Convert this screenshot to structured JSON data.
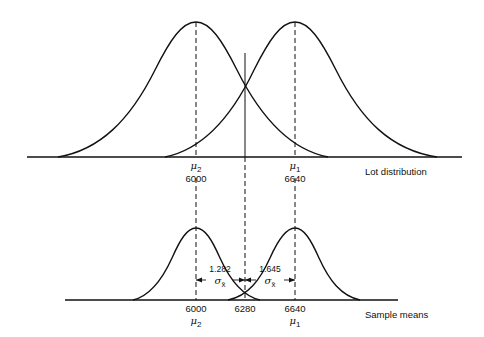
{
  "top": {
    "caption": "Lot distribution",
    "mu2": {
      "symbol": "μ",
      "sub": "2",
      "value": "6000"
    },
    "mu1": {
      "symbol": "μ",
      "sub": "1",
      "value": "6640"
    }
  },
  "bottom": {
    "caption": "Sample means",
    "left_value": "6000",
    "cut_value": "6280",
    "right_value": "6640",
    "mu2": {
      "symbol": "μ",
      "sub": "2"
    },
    "mu1": {
      "symbol": "μ",
      "sub": "1"
    },
    "left_span": {
      "z": "1.282",
      "sigma": "σ",
      "sub": "x̄"
    },
    "right_span": {
      "z": "1.645",
      "sigma": "σ",
      "sub": "x̄"
    }
  },
  "colors": {
    "line": "#111111",
    "background": "#ffffff"
  }
}
